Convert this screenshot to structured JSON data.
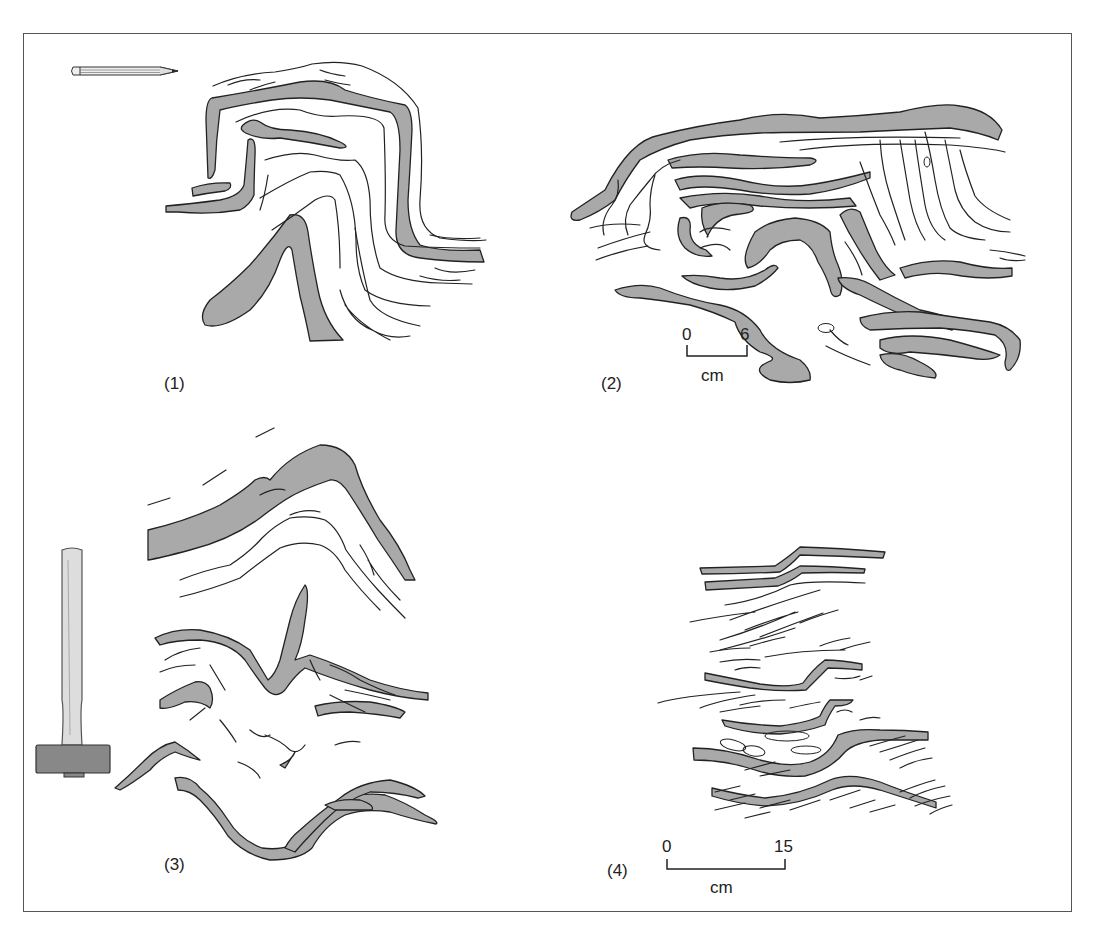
{
  "figure": {
    "panels": [
      {
        "id": "1",
        "label": "(1)",
        "description": "Recumbent fold in layered sediment"
      },
      {
        "id": "2",
        "label": "(2)",
        "description": "Complex convolute folding"
      },
      {
        "id": "3",
        "label": "(3)",
        "description": "Disrupted folded layers"
      },
      {
        "id": "4",
        "label": "(4)",
        "description": "Cross-laminated deformed beds"
      }
    ],
    "scale_bars": [
      {
        "panel": "2",
        "start": "0",
        "end": "6",
        "unit": "cm"
      },
      {
        "panel": "4",
        "start": "0",
        "end": "15",
        "unit": "cm"
      }
    ],
    "scale_objects": [
      {
        "panel": "1",
        "object": "pencil-icon"
      },
      {
        "panel": "3",
        "object": "hammer-icon"
      }
    ],
    "colors": {
      "layer_fill": "#a9a9a9",
      "line": "#222222",
      "frame": "#555555"
    }
  }
}
